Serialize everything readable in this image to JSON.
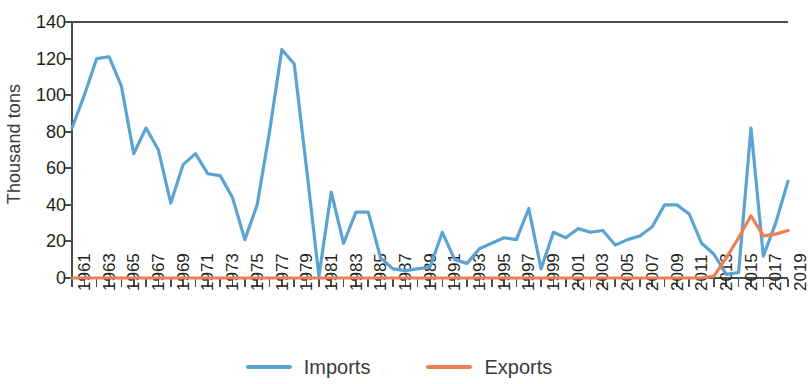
{
  "chart_data": {
    "type": "line",
    "title": "",
    "xlabel": "",
    "ylabel": "Thousand tons",
    "ylim": [
      0,
      140
    ],
    "yticks": [
      0,
      20,
      40,
      60,
      80,
      100,
      120,
      140
    ],
    "ytick_labels": [
      "0",
      "20",
      "40",
      "60",
      "80",
      "100",
      "120",
      "140"
    ],
    "xlim": [
      1961,
      2019
    ],
    "grid": false,
    "legend_position": "bottom-center",
    "x": [
      1961,
      1962,
      1963,
      1964,
      1965,
      1966,
      1967,
      1968,
      1969,
      1970,
      1971,
      1972,
      1973,
      1974,
      1975,
      1976,
      1977,
      1978,
      1979,
      1980,
      1981,
      1982,
      1983,
      1984,
      1985,
      1986,
      1987,
      1988,
      1989,
      1990,
      1991,
      1992,
      1993,
      1994,
      1995,
      1996,
      1997,
      1998,
      1999,
      2000,
      2001,
      2002,
      2003,
      2004,
      2005,
      2006,
      2007,
      2008,
      2009,
      2010,
      2011,
      2012,
      2013,
      2014,
      2015,
      2016,
      2017,
      2018,
      2019
    ],
    "xtick_labels": [
      "1961",
      "1963",
      "1965",
      "1967",
      "1969",
      "1971",
      "1973",
      "1975",
      "1977",
      "1979",
      "1981",
      "1983",
      "1985",
      "1987",
      "1989",
      "1991",
      "1993",
      "1995",
      "1997",
      "1999",
      "2001",
      "2003",
      "2005",
      "2007",
      "2009",
      "2011",
      "2013",
      "2015",
      "2017",
      "2019"
    ],
    "series": [
      {
        "name": "Imports",
        "color": "#5ba4d2",
        "values": [
          82,
          100,
          120,
          121,
          105,
          68,
          82,
          70,
          41,
          62,
          68,
          57,
          56,
          44,
          21,
          40,
          80,
          125,
          117,
          60,
          1,
          47,
          19,
          36,
          36,
          11,
          5,
          4,
          5,
          6,
          25,
          10,
          8,
          16,
          19,
          22,
          21,
          38,
          5,
          25,
          22,
          27,
          25,
          26,
          18,
          21,
          23,
          28,
          40,
          40,
          35,
          19,
          13,
          2,
          3,
          82,
          12,
          30,
          53
        ]
      },
      {
        "name": "Exports",
        "color": "#ee7f54",
        "values": [
          0,
          0,
          0,
          0,
          0,
          0,
          0,
          0,
          0,
          0,
          0,
          0,
          0,
          0,
          0,
          0,
          0,
          0,
          0,
          0,
          0,
          0,
          0,
          0,
          0,
          0,
          0,
          0,
          0,
          0,
          0,
          0,
          0,
          0,
          0,
          0,
          0,
          0,
          0,
          0,
          0,
          0,
          0,
          0,
          0,
          0,
          0,
          0,
          0,
          0,
          0,
          0,
          1,
          11,
          22,
          34,
          23,
          24,
          26
        ]
      }
    ]
  },
  "legend": {
    "items": [
      {
        "label": "Imports",
        "color": "#5ba4d2"
      },
      {
        "label": "Exports",
        "color": "#ee7f54"
      }
    ]
  },
  "axes": {
    "y_title": "Thousand tons"
  }
}
